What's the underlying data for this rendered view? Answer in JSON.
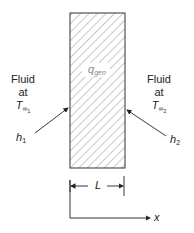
{
  "diagram": {
    "slab": {
      "label_main": "q",
      "label_sub": "gen",
      "fill_pattern": "diagonal-hatch",
      "stroke_color": "#333333"
    },
    "left_fluid": {
      "line1": "Fluid",
      "line2": "at",
      "temp_main": "T",
      "temp_sub": "∞",
      "temp_subsub": "1"
    },
    "right_fluid": {
      "line1": "Fluid",
      "line2": "at",
      "temp_main": "T",
      "temp_sub": "∞",
      "temp_subsub": "2"
    },
    "left_coefficient": {
      "main": "h",
      "sub": "1"
    },
    "right_coefficient": {
      "main": "h",
      "sub": "2"
    },
    "thickness": {
      "label": "L"
    },
    "axis": {
      "label": "x"
    }
  }
}
